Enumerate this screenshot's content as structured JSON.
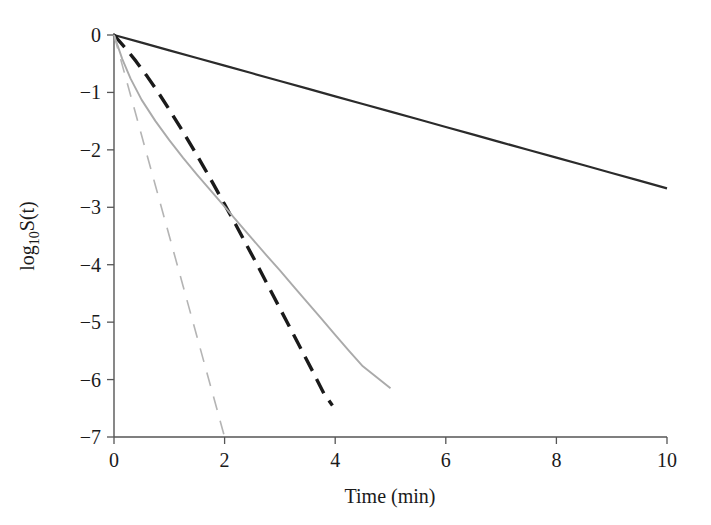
{
  "chart_data": {
    "type": "line",
    "title": "",
    "subtitle": "",
    "xlabel": "Time (min)",
    "ylabel": "log10S(t)",
    "ylabel_base": "log",
    "ylabel_subscript": "10",
    "ylabel_tail": "S(t)",
    "xlim": [
      0,
      10
    ],
    "ylim": [
      -7,
      0
    ],
    "grid": false,
    "legend": "none",
    "xticks": [
      0,
      2,
      4,
      6,
      8,
      10
    ],
    "xtick_labels": [
      "0",
      "2",
      "4",
      "6",
      "8",
      "10"
    ],
    "yticks": [
      0,
      -1,
      -2,
      -3,
      -4,
      -5,
      -6,
      -7
    ],
    "ytick_labels": [
      "0",
      "−1",
      "−2",
      "−3",
      "−4",
      "−5",
      "−6",
      "−7"
    ],
    "series": [
      {
        "name": "black-solid",
        "style": "solid",
        "color": "#2b2b2b",
        "width": 2.2,
        "dasharray": "",
        "x": [
          0,
          0.5,
          1,
          1.5,
          2,
          2.5,
          3,
          3.5,
          4,
          4.5,
          5,
          5.5,
          6,
          6.5,
          7,
          7.5,
          8,
          8.5,
          9,
          9.5,
          10
        ],
        "y": [
          0,
          -0.133,
          -0.267,
          -0.4,
          -0.534,
          -0.667,
          -0.801,
          -0.934,
          -1.068,
          -1.201,
          -1.335,
          -1.468,
          -1.602,
          -1.735,
          -1.869,
          -2.002,
          -2.136,
          -2.269,
          -2.403,
          -2.536,
          -2.67
        ]
      },
      {
        "name": "black-dashed",
        "style": "dashed",
        "color": "#1a1a1a",
        "width": 3.4,
        "dasharray": "16 9",
        "x": [
          0,
          0.2,
          0.4,
          0.6,
          0.8,
          1.0,
          1.2,
          1.4,
          1.6,
          1.8,
          2.0,
          2.2,
          2.4,
          2.6,
          2.8,
          3.0,
          3.2,
          3.4,
          3.6,
          3.8,
          3.95
        ],
        "y": [
          0,
          -0.22,
          -0.46,
          -0.72,
          -1.0,
          -1.3,
          -1.61,
          -1.93,
          -2.26,
          -2.6,
          -2.95,
          -3.3,
          -3.66,
          -4.02,
          -4.39,
          -4.76,
          -5.13,
          -5.5,
          -5.87,
          -6.25,
          -6.45
        ]
      },
      {
        "name": "gray-solid",
        "style": "solid",
        "color": "#aaaaaa",
        "width": 1.9,
        "dasharray": "",
        "x": [
          0,
          0.15,
          0.3,
          0.5,
          0.75,
          1.0,
          1.25,
          1.5,
          1.75,
          2.0,
          2.25,
          2.5,
          2.75,
          3.0,
          3.25,
          3.5,
          3.75,
          4.0,
          4.25,
          4.5,
          4.75,
          5.0
        ],
        "y": [
          0,
          -0.42,
          -0.76,
          -1.13,
          -1.5,
          -1.83,
          -2.14,
          -2.43,
          -2.71,
          -2.99,
          -3.27,
          -3.55,
          -3.83,
          -4.1,
          -4.38,
          -4.66,
          -4.94,
          -5.22,
          -5.5,
          -5.77,
          -5.96,
          -6.15
        ]
      },
      {
        "name": "gray-dashed",
        "style": "dashed",
        "color": "#b4b4b4",
        "width": 1.6,
        "dasharray": "14 11",
        "x": [
          0,
          0.25,
          0.5,
          0.75,
          1.0,
          1.25,
          1.5,
          1.75,
          2.0
        ],
        "y": [
          0,
          -0.875,
          -1.75,
          -2.625,
          -3.5,
          -4.375,
          -5.25,
          -6.125,
          -7.0
        ]
      }
    ]
  }
}
